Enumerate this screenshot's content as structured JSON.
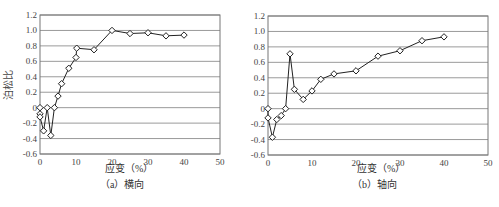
{
  "chart_data": [
    {
      "type": "line",
      "title": "",
      "caption": "（a）横向",
      "xlabel": "应变（%）",
      "ylabel": "泊松比",
      "xlim": [
        0,
        50
      ],
      "ylim": [
        -0.6,
        1.2
      ],
      "xticks": [
        0,
        10,
        20,
        30,
        40,
        50
      ],
      "yticks": [
        -0.6,
        -0.4,
        -0.2,
        0,
        0.2,
        0.4,
        0.6,
        0.8,
        1.0,
        1.2
      ],
      "ytick_labels": [
        "-0.6",
        "-0.4",
        "-0.2",
        "0",
        "0.2",
        "0.4",
        "0.6",
        "0.8",
        "1.0",
        "1.2"
      ],
      "grid": true,
      "marker": "diamond",
      "series": [
        {
          "name": "横向",
          "x": [
            0,
            0,
            0,
            1,
            2,
            3,
            4,
            5,
            6,
            8,
            10,
            10.2,
            15,
            20,
            25,
            30,
            35,
            40
          ],
          "y": [
            0,
            -0.08,
            -0.12,
            -0.3,
            0,
            -0.36,
            0,
            0.15,
            0.31,
            0.51,
            0.65,
            0.77,
            0.75,
            1.0,
            0.96,
            0.97,
            0.93,
            0.94
          ]
        }
      ]
    },
    {
      "type": "line",
      "title": "",
      "caption": "（b）轴向",
      "xlabel": "应变（%）",
      "ylabel": "泊松比",
      "xlim": [
        0,
        50
      ],
      "ylim": [
        -0.6,
        1.2
      ],
      "xticks": [
        0,
        10,
        20,
        30,
        40,
        50
      ],
      "yticks": [
        -0.6,
        -0.4,
        -0.2,
        0,
        0.2,
        0.4,
        0.6,
        0.8,
        1.0,
        1.2
      ],
      "ytick_labels": [
        "-0.6",
        "-0.4",
        "-0.2",
        "0",
        "0.2",
        "0.4",
        "0.6",
        "0.8",
        "1.0",
        "1.2"
      ],
      "grid": true,
      "marker": "diamond",
      "series": [
        {
          "name": "轴向",
          "x": [
            0,
            0,
            1,
            2,
            3,
            4,
            5,
            6,
            8,
            10,
            12,
            15,
            20,
            25,
            30,
            35,
            40
          ],
          "y": [
            0,
            -0.12,
            -0.37,
            -0.14,
            -0.09,
            0,
            0.71,
            0.25,
            0.12,
            0.23,
            0.38,
            0.45,
            0.49,
            0.68,
            0.75,
            0.88,
            0.93
          ]
        }
      ]
    }
  ]
}
